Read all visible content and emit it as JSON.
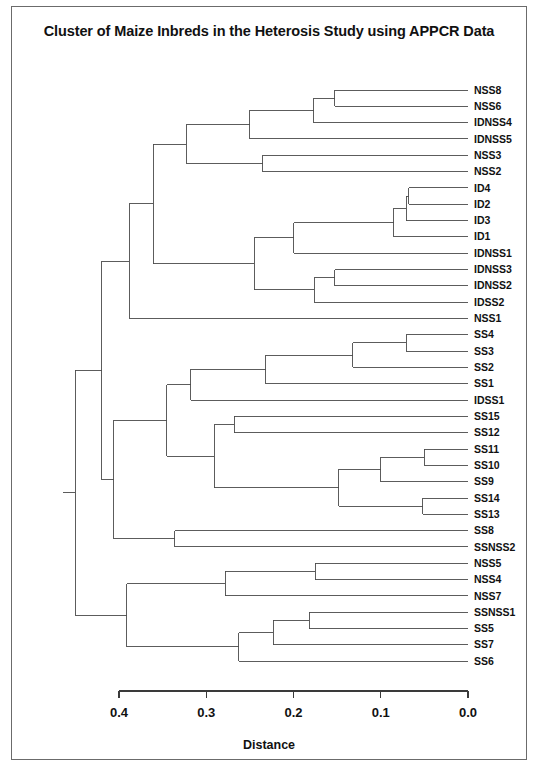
{
  "figure": {
    "title": "Cluster of Maize Inbreds in the Heterosis Study using APPCR Data",
    "axis_title": "Distance",
    "background": "#ffffff",
    "line_color": "#4a4a4a",
    "text_color": "#111111",
    "border_color": "#6b6b6b"
  },
  "chart_data": {
    "type": "dendrogram",
    "title": "Cluster of Maize Inbreds in the Heterosis Study using APPCR Data",
    "xlabel": "Distance",
    "ylabel": "",
    "orientation": "horizontal-right-leaves",
    "xlim": [
      0.4,
      0.0
    ],
    "x_reversed": true,
    "grid": false,
    "legend": "none",
    "tick_labels": [
      "0.4",
      "0.3",
      "0.2",
      "0.1",
      "0.0"
    ],
    "tick_values": [
      0.4,
      0.3,
      0.2,
      0.1,
      0.0
    ],
    "leaves": [
      "NSS8",
      "NSS6",
      "IDNSS4",
      "IDNSS5",
      "NSS3",
      "NSS2",
      "ID4",
      "ID2",
      "ID3",
      "ID1",
      "IDNSS1",
      "IDNSS3",
      "IDNSS2",
      "IDSS2",
      "NSS1",
      "SS4",
      "SS3",
      "SS2",
      "SS1",
      "IDSS1",
      "SS15",
      "SS12",
      "SS11",
      "SS10",
      "SS9",
      "SS14",
      "SS13",
      "SS8",
      "SSNSS2",
      "NSS5",
      "NSS4",
      "NSS7",
      "SSNSS1",
      "SS5",
      "SS7",
      "SS6"
    ],
    "n_leaves": 36,
    "merges": [
      {
        "id": "m1",
        "left": "NSS8",
        "right": "NSS6",
        "distance": 0.153
      },
      {
        "id": "m2",
        "left": "m1",
        "right": "IDNSS4",
        "distance": 0.177
      },
      {
        "id": "m3",
        "left": "NSS3",
        "right": "NSS2",
        "distance": 0.235
      },
      {
        "id": "m4",
        "left": "m2",
        "right": "IDNSS5",
        "distance": 0.25
      },
      {
        "id": "m5",
        "left": "m4",
        "right": "m3",
        "distance": 0.323
      },
      {
        "id": "m6",
        "left": "ID4",
        "right": "ID2",
        "distance": 0.068
      },
      {
        "id": "m7",
        "left": "m6",
        "right": "ID3",
        "distance": 0.071
      },
      {
        "id": "m8",
        "left": "m7",
        "right": "ID1",
        "distance": 0.085
      },
      {
        "id": "m9",
        "left": "IDNSS3",
        "right": "IDNSS2",
        "distance": 0.153
      },
      {
        "id": "m10",
        "left": "m9",
        "right": "IDSS2",
        "distance": 0.176
      },
      {
        "id": "m11",
        "left": "m8",
        "right": "IDNSS1",
        "distance": 0.2
      },
      {
        "id": "m12",
        "left": "m11",
        "right": "m10",
        "distance": 0.245
      },
      {
        "id": "m13",
        "left": "m5",
        "right": "m12",
        "distance": 0.361
      },
      {
        "id": "m14",
        "left": "m13",
        "right": "NSS1",
        "distance": 0.388
      },
      {
        "id": "m15",
        "left": "SS4",
        "right": "SS3",
        "distance": 0.071
      },
      {
        "id": "m16",
        "left": "m15",
        "right": "SS2",
        "distance": 0.132
      },
      {
        "id": "m17",
        "left": "m16",
        "right": "SS1",
        "distance": 0.232
      },
      {
        "id": "m18",
        "left": "m17",
        "right": "IDSS1",
        "distance": 0.318
      },
      {
        "id": "m19",
        "left": "SS15",
        "right": "SS12",
        "distance": 0.268
      },
      {
        "id": "m20",
        "left": "SS11",
        "right": "SS10",
        "distance": 0.05
      },
      {
        "id": "m21",
        "left": "m20",
        "right": "SS9",
        "distance": 0.1
      },
      {
        "id": "m22",
        "left": "SS14",
        "right": "SS13",
        "distance": 0.052
      },
      {
        "id": "m23",
        "left": "m21",
        "right": "m22",
        "distance": 0.148
      },
      {
        "id": "m24",
        "left": "m19",
        "right": "m23",
        "distance": 0.291
      },
      {
        "id": "m25",
        "left": "m18",
        "right": "m24",
        "distance": 0.345
      },
      {
        "id": "m26",
        "left": "SS8",
        "right": "SSNSS2",
        "distance": 0.336
      },
      {
        "id": "m27",
        "left": "m25",
        "right": "m26",
        "distance": 0.406
      },
      {
        "id": "m28",
        "left": "NSS5",
        "right": "NSS4",
        "distance": 0.175
      },
      {
        "id": "m29",
        "left": "m28",
        "right": "NSS7",
        "distance": 0.278
      },
      {
        "id": "m30",
        "left": "SSNSS1",
        "right": "SS5",
        "distance": 0.182
      },
      {
        "id": "m31",
        "left": "m30",
        "right": "SS7",
        "distance": 0.223
      },
      {
        "id": "m32",
        "left": "m31",
        "right": "SS6",
        "distance": 0.263
      },
      {
        "id": "m33",
        "left": "m29",
        "right": "m32",
        "distance": 0.391
      },
      {
        "id": "m34",
        "left": "m14",
        "right": "m27",
        "distance": 0.42
      },
      {
        "id": "m35",
        "left": "m34",
        "right": "m33",
        "distance": 0.45
      }
    ]
  }
}
